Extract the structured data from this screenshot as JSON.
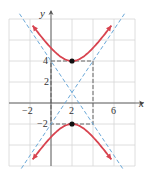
{
  "chart_data": {
    "type": "line",
    "title": "",
    "xlabel": "x",
    "ylabel": "y",
    "xlim": [
      -4,
      8
    ],
    "ylim": [
      -6,
      8
    ],
    "grid": true,
    "grid_step": 2,
    "x_ticks": [
      "-2",
      "2",
      "6"
    ],
    "y_ticks": [
      "4",
      "2",
      "-2"
    ],
    "series": [
      {
        "name": "hyperbola upper branch",
        "equation": "(y-1)^2/9 - (x-2)^2/4 = 1",
        "color": "#d8434f",
        "style": "solid"
      },
      {
        "name": "hyperbola lower branch",
        "equation": "(y-1)^2/9 - (x-2)^2/4 = 1",
        "color": "#d8434f",
        "style": "solid"
      },
      {
        "name": "asymptote 1",
        "equation": "y - 1 = 1.5 (x - 2)",
        "color": "#6aa8d8",
        "style": "dashed"
      },
      {
        "name": "asymptote 2",
        "equation": "y - 1 = -1.5 (x - 2)",
        "color": "#6aa8d8",
        "style": "dashed"
      }
    ],
    "points": [
      {
        "label": "vertex",
        "x": 2,
        "y": 4
      },
      {
        "label": "vertex",
        "x": 2,
        "y": -2
      }
    ],
    "guide_box": {
      "x": [
        0,
        4
      ],
      "y": [
        -2,
        4
      ],
      "style": "dashed",
      "color": "#333333"
    }
  },
  "labels": {
    "x_axis": "x",
    "y_axis": "y",
    "tick_x_neg2": "−2",
    "tick_x_2": "2",
    "tick_x_6": "6",
    "tick_y_4": "4",
    "tick_y_2": "2",
    "tick_y_neg2": "−2"
  }
}
